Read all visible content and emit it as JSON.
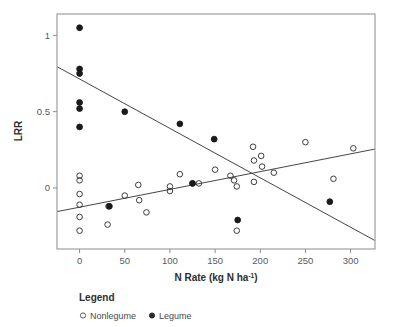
{
  "chart_data": {
    "type": "scatter",
    "title": "",
    "xlabel": "N Rate (kg N ha-1)",
    "xlabel_main": "N Rate (kg N ha",
    "xlabel_sup": "-1",
    "xlabel_tail": ")",
    "ylabel": "LRR",
    "xlim": [
      -25,
      327
    ],
    "ylim": [
      -0.4,
      1.14
    ],
    "xticks": [
      0,
      50,
      100,
      150,
      200,
      250,
      300
    ],
    "xtick_labels": [
      "0",
      "50",
      "100",
      "150",
      "200",
      "250",
      "300"
    ],
    "yticks": [
      0,
      0.5,
      1
    ],
    "ytick_labels": [
      "0",
      "0.5",
      "1"
    ],
    "grid": false,
    "frame": "box",
    "legend": {
      "title": "Legend",
      "position": "below-left",
      "entries": [
        {
          "name": "Nonlegume",
          "marker": "open-circle",
          "color": "#3d3d3d"
        },
        {
          "name": "Legume",
          "marker": "filled-circle",
          "color": "#1a1a1a"
        }
      ]
    },
    "series": [
      {
        "name": "Nonlegume",
        "marker": "open-circle",
        "color": "#3d3d3d",
        "points": [
          {
            "x": 0,
            "y": 0.08
          },
          {
            "x": 0,
            "y": 0.05
          },
          {
            "x": 0,
            "y": -0.04
          },
          {
            "x": 0,
            "y": -0.11
          },
          {
            "x": 0,
            "y": -0.19
          },
          {
            "x": 0,
            "y": -0.28
          },
          {
            "x": 32,
            "y": -0.12
          },
          {
            "x": 31,
            "y": -0.24
          },
          {
            "x": 50,
            "y": -0.05
          },
          {
            "x": 65,
            "y": 0.02
          },
          {
            "x": 66,
            "y": -0.08
          },
          {
            "x": 74,
            "y": -0.16
          },
          {
            "x": 100,
            "y": 0.01
          },
          {
            "x": 100,
            "y": -0.02
          },
          {
            "x": 111,
            "y": 0.09
          },
          {
            "x": 125,
            "y": 0.03
          },
          {
            "x": 132,
            "y": 0.03
          },
          {
            "x": 150,
            "y": 0.12
          },
          {
            "x": 167,
            "y": 0.08
          },
          {
            "x": 171,
            "y": 0.05
          },
          {
            "x": 174,
            "y": 0.01
          },
          {
            "x": 174,
            "y": -0.28
          },
          {
            "x": 192,
            "y": 0.27
          },
          {
            "x": 193,
            "y": 0.18
          },
          {
            "x": 193,
            "y": 0.04
          },
          {
            "x": 201,
            "y": 0.21
          },
          {
            "x": 202,
            "y": 0.14
          },
          {
            "x": 215,
            "y": 0.1
          },
          {
            "x": 250,
            "y": 0.3
          },
          {
            "x": 281,
            "y": 0.06
          },
          {
            "x": 303,
            "y": 0.26
          }
        ]
      },
      {
        "name": "Legume",
        "marker": "filled-circle",
        "color": "#1a1a1a",
        "points": [
          {
            "x": 0,
            "y": 1.05
          },
          {
            "x": 0,
            "y": 0.78
          },
          {
            "x": 0,
            "y": 0.75
          },
          {
            "x": 0,
            "y": 0.56
          },
          {
            "x": 0,
            "y": 0.52
          },
          {
            "x": 0,
            "y": 0.4
          },
          {
            "x": 33,
            "y": -0.12
          },
          {
            "x": 50,
            "y": 0.5
          },
          {
            "x": 111,
            "y": 0.42
          },
          {
            "x": 125,
            "y": 0.03
          },
          {
            "x": 149,
            "y": 0.32
          },
          {
            "x": 175,
            "y": -0.21
          },
          {
            "x": 277,
            "y": -0.09
          }
        ]
      }
    ],
    "trendlines": [
      {
        "name": "Legume trend",
        "series": "Legume",
        "x1": -25,
        "y1": 0.795,
        "x2": 327,
        "y2": -0.345
      },
      {
        "name": "Nonlegume trend",
        "series": "Nonlegume",
        "x1": -25,
        "y1": -0.155,
        "x2": 327,
        "y2": 0.255
      }
    ]
  }
}
